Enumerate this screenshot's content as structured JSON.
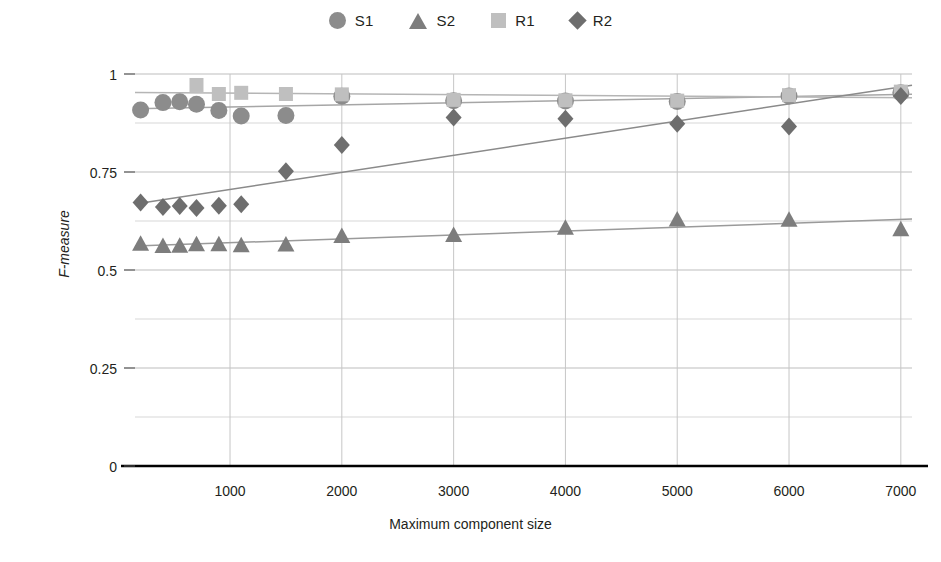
{
  "chart_data": {
    "type": "scatter",
    "title": "",
    "xlabel": "Maximum component size",
    "ylabel": "F-measure",
    "xlim": [
      150,
      7100
    ],
    "ylim": [
      0,
      1
    ],
    "xticks": [
      1000,
      2000,
      3000,
      4000,
      5000,
      6000,
      7000
    ],
    "yticks": [
      0,
      0.25,
      0.5,
      0.75,
      1
    ],
    "ytick_labels": [
      "0",
      "0.25",
      "0.5",
      "0.75",
      "1"
    ],
    "xtick_labels": [
      "1000",
      "2000",
      "3000",
      "4000",
      "5000",
      "6000",
      "7000"
    ],
    "minor_gridlines_y": [
      0.125,
      0.375,
      0.625,
      0.875
    ],
    "grid": true,
    "legend_position": "top-center",
    "series": [
      {
        "name": "S1",
        "marker": "circle",
        "color": "#8c8c8c",
        "trendline": true,
        "trendline_color": "#a6a6a6",
        "points": [
          {
            "x": 200,
            "y": 0.908
          },
          {
            "x": 400,
            "y": 0.927
          },
          {
            "x": 550,
            "y": 0.929
          },
          {
            "x": 700,
            "y": 0.923
          },
          {
            "x": 900,
            "y": 0.907
          },
          {
            "x": 1100,
            "y": 0.893
          },
          {
            "x": 1500,
            "y": 0.894
          },
          {
            "x": 2000,
            "y": 0.943
          },
          {
            "x": 3000,
            "y": 0.932
          },
          {
            "x": 4000,
            "y": 0.931
          },
          {
            "x": 5000,
            "y": 0.93
          },
          {
            "x": 6000,
            "y": 0.944
          },
          {
            "x": 7000,
            "y": 0.952
          }
        ]
      },
      {
        "name": "S2",
        "marker": "triangle",
        "color": "#7d7d7d",
        "trendline": true,
        "trendline_color": "#9a9a9a",
        "points": [
          {
            "x": 200,
            "y": 0.567
          },
          {
            "x": 400,
            "y": 0.561
          },
          {
            "x": 550,
            "y": 0.562
          },
          {
            "x": 700,
            "y": 0.566
          },
          {
            "x": 900,
            "y": 0.566
          },
          {
            "x": 1100,
            "y": 0.563
          },
          {
            "x": 1500,
            "y": 0.565
          },
          {
            "x": 2000,
            "y": 0.587
          },
          {
            "x": 3000,
            "y": 0.589
          },
          {
            "x": 4000,
            "y": 0.608
          },
          {
            "x": 5000,
            "y": 0.629
          },
          {
            "x": 6000,
            "y": 0.628
          },
          {
            "x": 7000,
            "y": 0.604
          }
        ]
      },
      {
        "name": "R1",
        "marker": "square",
        "color": "#bfbfbf",
        "trendline": true,
        "trendline_color": "#b5b5b5",
        "points": [
          {
            "x": 700,
            "y": 0.972
          },
          {
            "x": 900,
            "y": 0.949
          },
          {
            "x": 1100,
            "y": 0.952
          },
          {
            "x": 1500,
            "y": 0.949
          },
          {
            "x": 2000,
            "y": 0.948
          },
          {
            "x": 3000,
            "y": 0.934
          },
          {
            "x": 4000,
            "y": 0.933
          },
          {
            "x": 5000,
            "y": 0.932
          },
          {
            "x": 6000,
            "y": 0.946
          },
          {
            "x": 7000,
            "y": 0.955
          }
        ]
      },
      {
        "name": "R2",
        "marker": "diamond",
        "color": "#6e6e6e",
        "trendline": true,
        "trendline_color": "#8a8a8a",
        "points": [
          {
            "x": 200,
            "y": 0.672
          },
          {
            "x": 400,
            "y": 0.661
          },
          {
            "x": 550,
            "y": 0.663
          },
          {
            "x": 700,
            "y": 0.658
          },
          {
            "x": 900,
            "y": 0.664
          },
          {
            "x": 1100,
            "y": 0.668
          },
          {
            "x": 1500,
            "y": 0.752
          },
          {
            "x": 2000,
            "y": 0.819
          },
          {
            "x": 3000,
            "y": 0.889
          },
          {
            "x": 4000,
            "y": 0.886
          },
          {
            "x": 5000,
            "y": 0.873
          },
          {
            "x": 6000,
            "y": 0.866
          },
          {
            "x": 7000,
            "y": 0.944
          }
        ]
      }
    ]
  },
  "legend": {
    "items": [
      {
        "label": "S1",
        "marker": "circle",
        "color": "#8c8c8c"
      },
      {
        "label": "S2",
        "marker": "triangle",
        "color": "#7d7d7d"
      },
      {
        "label": "R1",
        "marker": "square",
        "color": "#bfbfbf"
      },
      {
        "label": "R2",
        "marker": "diamond",
        "color": "#6e6e6e"
      }
    ]
  },
  "axes": {
    "x_title": "Maximum component size",
    "y_title": "F-measure"
  }
}
